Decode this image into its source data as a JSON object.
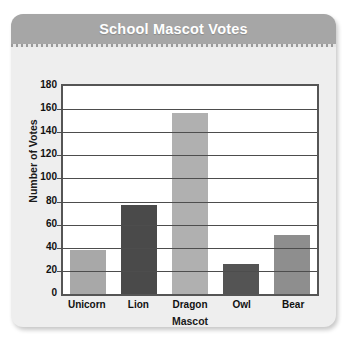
{
  "card": {
    "title": "School Mascot Votes"
  },
  "chart_data": {
    "type": "bar",
    "title": "School Mascot Votes",
    "xlabel": "Mascot",
    "ylabel": "Number of Votes",
    "categories": [
      "Unicorn",
      "Lion",
      "Dragon",
      "Owl",
      "Bear"
    ],
    "values": [
      38,
      77,
      157,
      26,
      51
    ],
    "colors": [
      "#a8a8a8",
      "#4a4a4a",
      "#b0b0b0",
      "#545454",
      "#8e8e8e"
    ],
    "ylim": [
      0,
      180
    ],
    "ytick_step": 20,
    "yticks": [
      180,
      160,
      140,
      120,
      100,
      80,
      60,
      40,
      20,
      0
    ],
    "grid": true,
    "legend": false
  }
}
